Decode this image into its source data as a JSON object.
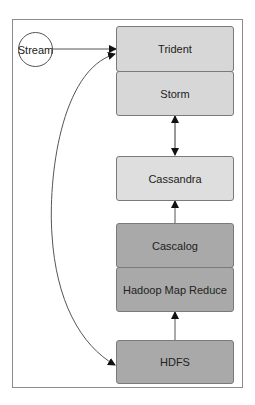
{
  "diagram": {
    "source": {
      "label": "Stream"
    },
    "nodes": [
      {
        "id": "trident",
        "label": "Trident",
        "fill": "#d7d7d7"
      },
      {
        "id": "storm",
        "label": "Storm",
        "fill": "#d7d7d7"
      },
      {
        "id": "cassandra",
        "label": "Cassandra",
        "fill": "#dedede"
      },
      {
        "id": "cascalog",
        "label": "Cascalog",
        "fill": "#a9a9a9"
      },
      {
        "id": "hadoop",
        "label": "Hadoop Map Reduce",
        "fill": "#a9a9a9"
      },
      {
        "id": "hdfs",
        "label": "HDFS",
        "fill": "#a9a9a9"
      }
    ],
    "edges": [
      {
        "from": "Stream",
        "to": "Trident",
        "type": "straight-arrow"
      },
      {
        "from": "Storm",
        "to": "Cassandra",
        "type": "bidirectional-arrow"
      },
      {
        "from": "Cascalog",
        "to": "Cassandra",
        "type": "straight-arrow"
      },
      {
        "from": "HDFS",
        "to": "Hadoop Map Reduce",
        "type": "straight-arrow"
      },
      {
        "from": "Trident",
        "to": "HDFS",
        "type": "curved-bidirectional-arrow"
      }
    ]
  }
}
